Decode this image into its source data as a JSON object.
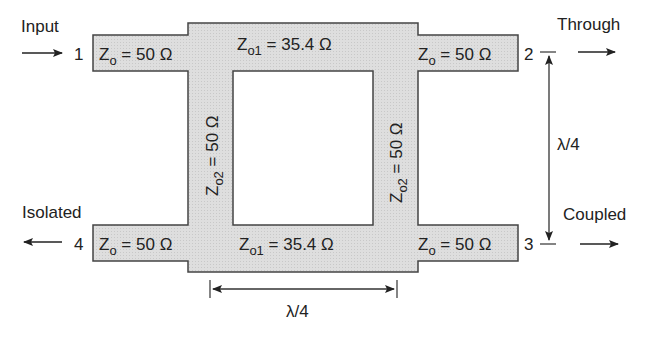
{
  "diagram": {
    "colors": {
      "line_fill": "#dcdcdc",
      "stroke": "#444444",
      "text": "#222222",
      "background": "#ffffff"
    },
    "ports": [
      {
        "number": "1",
        "name": "Input",
        "direction": "in"
      },
      {
        "number": "2",
        "name": "Through",
        "direction": "out"
      },
      {
        "number": "3",
        "name": "Coupled",
        "direction": "out"
      },
      {
        "number": "4",
        "name": "Isolated",
        "direction": "out"
      }
    ],
    "port_lines": {
      "p1": {
        "label": "Z",
        "sub": "o",
        "value": " = 50 Ω"
      },
      "p2": {
        "label": "Z",
        "sub": "o",
        "value": " = 50 Ω"
      },
      "p3": {
        "label": "Z",
        "sub": "o",
        "value": " = 50 Ω"
      },
      "p4": {
        "label": "Z",
        "sub": "o",
        "value": " = 50 Ω"
      }
    },
    "series_arms": {
      "top": {
        "label": "Z",
        "sub": "o1",
        "value": " = 35.4 Ω"
      },
      "bottom": {
        "label": "Z",
        "sub": "o1",
        "value": " = 35.4 Ω"
      }
    },
    "shunt_arms": {
      "left": {
        "label": "Z",
        "sub": "o2",
        "value": " = 50 Ω"
      },
      "right": {
        "label": "Z",
        "sub": "o2",
        "value": " = 50 Ω"
      }
    },
    "dimensions": {
      "horizontal": "λ/4",
      "vertical": "λ/4"
    }
  }
}
